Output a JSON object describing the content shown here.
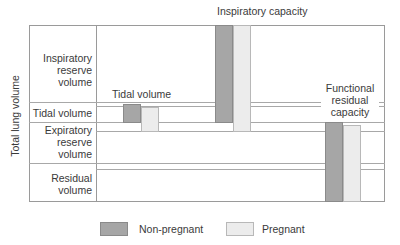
{
  "title": "Inspiratory capacity",
  "y_axis_label": "Total lung volume",
  "row_labels": {
    "irv": "Inspiratory reserve volume",
    "tv": "Tidal volume",
    "erv": "Expiratory reserve volume",
    "rv": "Residual volume"
  },
  "annotations": {
    "tidal_volume": "Tidal volume",
    "frc": "Functional residual capacity"
  },
  "legend": [
    {
      "label": "Non-pregnant",
      "color": "#a6a6a6"
    },
    {
      "label": "Pregnant",
      "color": "#ececec"
    }
  ],
  "colors": {
    "non_pregnant": "#a6a6a6",
    "pregnant": "#ececec",
    "lines": "#a8a8a8"
  },
  "comparison": [
    {
      "measure": "Tidal volume",
      "non_pregnant": "baseline",
      "pregnant": "increased"
    },
    {
      "measure": "Inspiratory capacity",
      "non_pregnant": "baseline",
      "pregnant": "increased"
    },
    {
      "measure": "Functional residual capacity",
      "non_pregnant": "baseline",
      "pregnant": "decreased"
    }
  ]
}
